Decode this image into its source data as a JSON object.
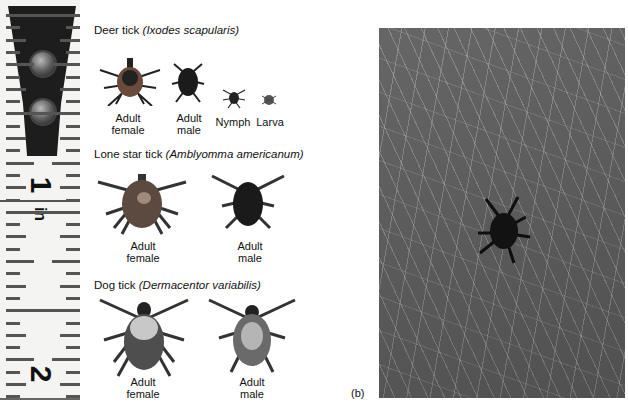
{
  "ruler": {
    "numbers": [
      "1",
      "2"
    ],
    "unit": "in"
  },
  "panel_a": {
    "groups": [
      {
        "common_name": "Deer tick",
        "scientific_name": "(Ixodes scapularis)",
        "specimens": [
          {
            "label_line1": "Adult",
            "label_line2": "female"
          },
          {
            "label_line1": "Adult",
            "label_line2": "male"
          },
          {
            "label_line1": "Nymph",
            "label_line2": ""
          },
          {
            "label_line1": "Larva",
            "label_line2": ""
          }
        ]
      },
      {
        "common_name": "Lone star tick",
        "scientific_name": "(Amblyomma americanum)",
        "specimens": [
          {
            "label_line1": "Adult",
            "label_line2": "female"
          },
          {
            "label_line1": "Adult",
            "label_line2": "male"
          }
        ]
      },
      {
        "common_name": "Dog tick",
        "scientific_name": "(Dermacentor variabilis)",
        "specimens": [
          {
            "label_line1": "Adult",
            "label_line2": "female"
          },
          {
            "label_line1": "Adult",
            "label_line2": "male"
          }
        ]
      }
    ]
  },
  "panel_b": {
    "label": "(b)"
  }
}
